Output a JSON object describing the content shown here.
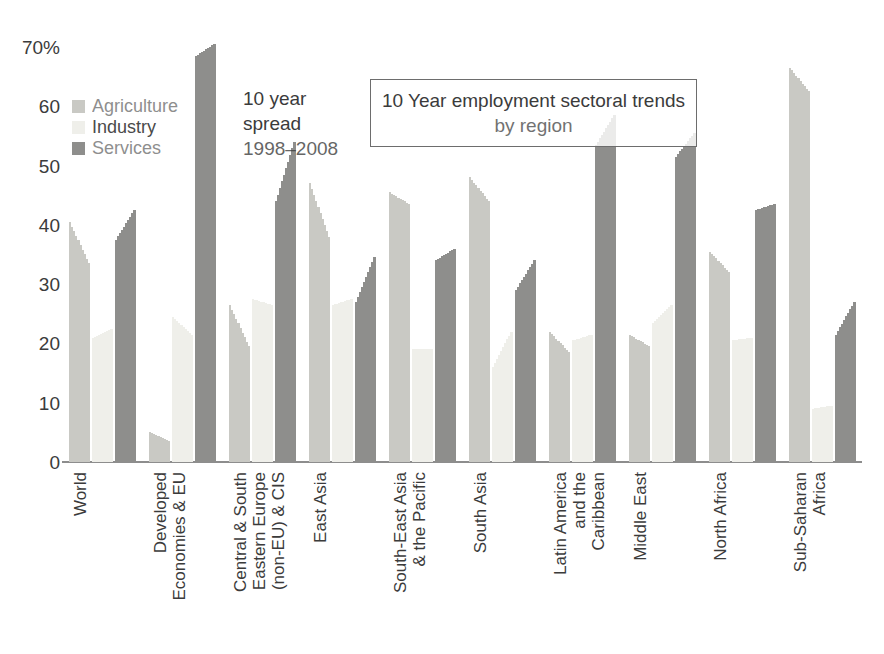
{
  "chart_data": {
    "type": "bar",
    "title": "10 Year employment sectoral trends by region",
    "title_line1": "10 Year employment sectoral trends",
    "title_line2": "by region",
    "annotation": {
      "line1": "10 year",
      "line2": "spread",
      "line3": "1998–2008"
    },
    "xlabel": "",
    "ylabel": "",
    "ylim": [
      0,
      72
    ],
    "ytick_labels": [
      "0",
      "10",
      "20",
      "30",
      "40",
      "50",
      "60",
      "70%"
    ],
    "ytick_values": [
      0,
      10,
      20,
      30,
      40,
      50,
      60,
      70
    ],
    "grid": false,
    "legend_position": "upper-left",
    "legend": [
      "Agriculture",
      "Industry",
      "Services"
    ],
    "series_colors": {
      "Agriculture": "#c9c9c4",
      "Industry": "#efefea",
      "Services": "#8e8e8c"
    },
    "note": "Each bar is a 10-year spread bar: it spans the 1998 value to the 2008 value, drawn as a descending/ascending staircase.",
    "categories": [
      "World",
      "Developed Economies & EU",
      "Central & South Eastern Europe (non-EU) & CIS",
      "East Asia",
      "South-East Asia & the Pacific",
      "South Asia",
      "Latin America and the Caribbean",
      "Middle East",
      "North Africa",
      "Sub-Saharan Africa"
    ],
    "series": [
      {
        "name": "Agriculture",
        "v1998": [
          40.5,
          5.0,
          26.5,
          47.0,
          45.5,
          48.0,
          22.0,
          21.5,
          35.5,
          66.5
        ],
        "v2008": [
          33.5,
          3.5,
          19.5,
          38.0,
          43.5,
          44.0,
          18.5,
          19.5,
          32.0,
          62.5
        ]
      },
      {
        "name": "Industry",
        "v1998": [
          21.0,
          24.5,
          27.5,
          26.5,
          19.0,
          16.0,
          20.5,
          23.5,
          20.5,
          9.0
        ],
        "v2008": [
          22.5,
          21.5,
          26.5,
          27.5,
          19.0,
          22.0,
          21.5,
          26.5,
          21.0,
          9.5
        ]
      },
      {
        "name": "Services",
        "v1998": [
          37.5,
          68.5,
          44.0,
          27.0,
          34.0,
          29.0,
          53.5,
          51.5,
          42.5,
          21.5
        ],
        "v2008": [
          42.5,
          70.5,
          54.0,
          34.5,
          36.0,
          34.0,
          58.5,
          55.5,
          43.5,
          27.0
        ]
      }
    ]
  },
  "axis": {
    "yticks": [
      {
        "label": "70%",
        "value": 70
      },
      {
        "label": "60",
        "value": 60
      },
      {
        "label": "50",
        "value": 50
      },
      {
        "label": "40",
        "value": 40
      },
      {
        "label": "30",
        "value": 30
      },
      {
        "label": "20",
        "value": 20
      },
      {
        "label": "10",
        "value": 10
      },
      {
        "label": "0",
        "value": 0
      }
    ]
  }
}
